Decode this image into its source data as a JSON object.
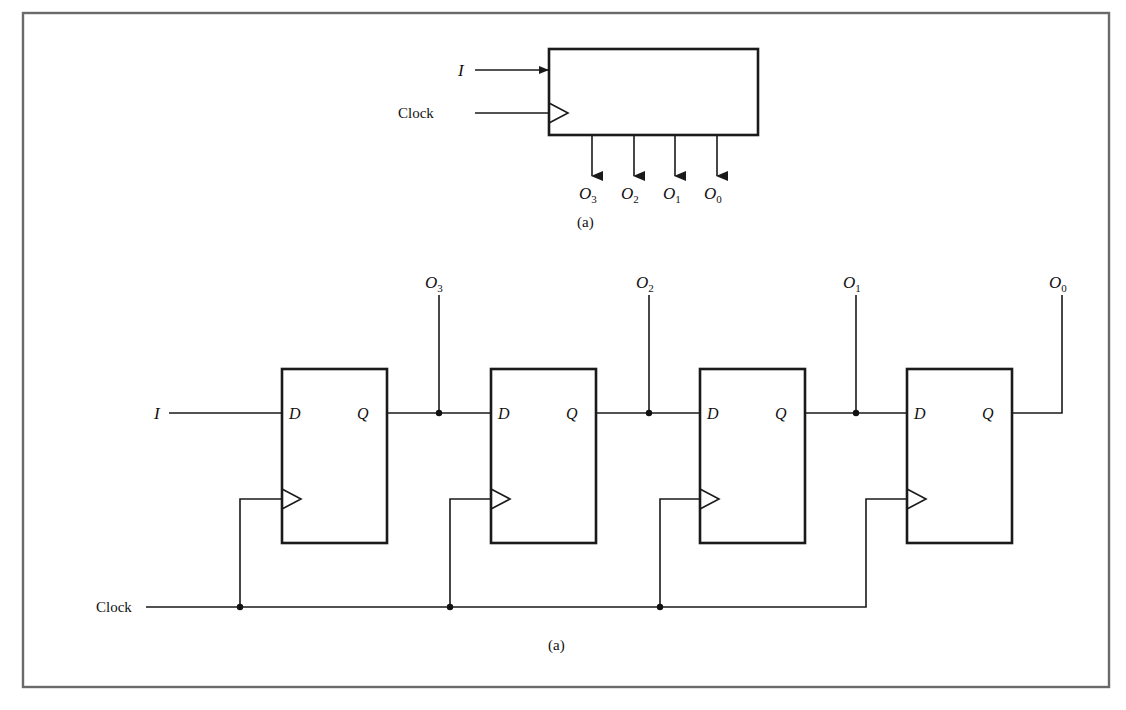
{
  "figure": {
    "top_diagram": {
      "caption": "(a)",
      "input_label": "I",
      "clock_label": "Clock",
      "outputs": [
        {
          "base": "O",
          "sub": "3"
        },
        {
          "base": "O",
          "sub": "2"
        },
        {
          "base": "O",
          "sub": "1"
        },
        {
          "base": "O",
          "sub": "0"
        }
      ]
    },
    "bottom_diagram": {
      "caption": "(a)",
      "input_label": "I",
      "clock_label": "Clock",
      "flip_flops": [
        {
          "d_label": "D",
          "q_label": "Q"
        },
        {
          "d_label": "D",
          "q_label": "Q"
        },
        {
          "d_label": "D",
          "q_label": "Q"
        },
        {
          "d_label": "D",
          "q_label": "Q"
        }
      ],
      "outputs": [
        {
          "base": "O",
          "sub": "3"
        },
        {
          "base": "O",
          "sub": "2"
        },
        {
          "base": "O",
          "sub": "1"
        },
        {
          "base": "O",
          "sub": "0"
        }
      ]
    }
  }
}
